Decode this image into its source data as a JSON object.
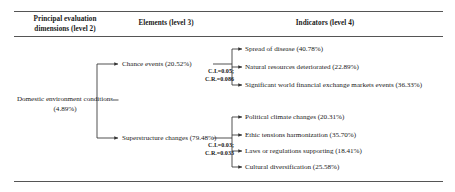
{
  "headers": {
    "level2": "Principal evaluation dimensions (level 2)",
    "level3": "Elements (level 3)",
    "level4": "Indicators (level 4)"
  },
  "root": {
    "label": "Domestic environment conditions (4.89%)"
  },
  "branches": [
    {
      "label": "Chance events (20.52%)",
      "consistency": {
        "ci": "C.I.=0.05;",
        "cr": "C.R.=0.086"
      },
      "indicators": [
        "Spread of disease (40.78%)",
        "Natural resources deteriorated (22.89%)",
        "Significant world financial exchange markets events (36.33%)"
      ]
    },
    {
      "label": "Superstructure changes (79.48%)",
      "consistency": {
        "ci": "C.I.=0.03;",
        "cr": "C.R.=0.033"
      },
      "indicators": [
        "Political climate changes (20.31%)",
        "Ethic tensions harmonization (35.70%)",
        "Laws or regulations supporting (18.41%)",
        "Cultural diversification (25.58%)"
      ]
    }
  ],
  "style": {
    "line_color": "#333333",
    "rule_color": "#555555",
    "text_color": "#1a1a1a"
  }
}
